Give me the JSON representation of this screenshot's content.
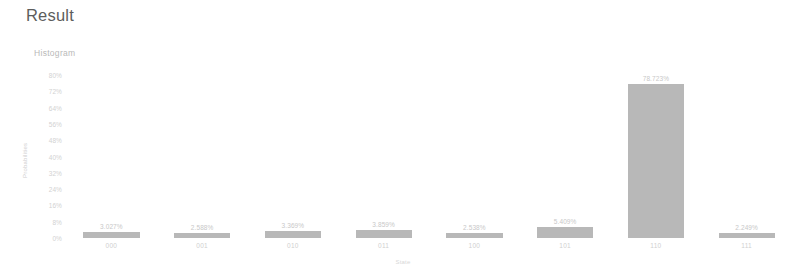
{
  "page": {
    "title": "Result",
    "panel_label": "Histogram",
    "corner_badge": "",
    "background": "#ffffff",
    "bar_color": "#b8b8b8",
    "text_color": "#5d5d5d"
  },
  "chart_data": {
    "type": "bar",
    "title": "Histogram",
    "xlabel": "State",
    "ylabel": "Probabilities",
    "categories": [
      "000",
      "001",
      "010",
      "011",
      "100",
      "101",
      "110",
      "111"
    ],
    "values": [
      3.027,
      2.588,
      3.369,
      3.859,
      2.538,
      5.409,
      78.723,
      2.249
    ],
    "data_labels": [
      "3.027%",
      "2.588%",
      "3.369%",
      "3.859%",
      "2.538%",
      "5.409%",
      "78.723%",
      "2.249%"
    ],
    "ylim": [
      0,
      80
    ],
    "ytick_values": [
      0,
      8,
      16,
      24,
      32,
      40,
      48,
      56,
      64,
      72,
      80
    ],
    "ytick_labels": [
      "0%",
      "8%",
      "16%",
      "24%",
      "32%",
      "40%",
      "48%",
      "56%",
      "64%",
      "72%",
      "80%"
    ],
    "grid": false,
    "legend": false
  }
}
